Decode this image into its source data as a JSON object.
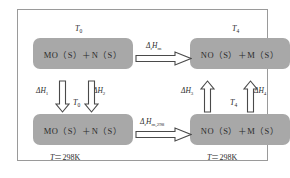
{
  "diagram": {
    "boxes": {
      "top_left": "MO（S）＋N（S）",
      "top_right": "NO（S）＋M（S）",
      "bottom_left": "MO（S）＋N（S）",
      "bottom_right": "NO（S）＋M（S）"
    },
    "temperatures": {
      "top_left": "T",
      "top_left_sub": "0",
      "top_right": "T",
      "top_right_sub": "4",
      "mid_left": "T",
      "mid_left_sub": "0",
      "mid_right": "T",
      "mid_right_sub": "4",
      "bottom_left": "T",
      "bottom_left_eq": "＝298K",
      "bottom_right": "T",
      "bottom_right_eq": "＝298K"
    },
    "enthalpies": {
      "top": "Δ",
      "top_sub1": "r",
      "top_main": "H",
      "top_sub2": "m",
      "bottom": "Δ",
      "bottom_sub1": "r",
      "bottom_main": "H",
      "bottom_sub2": "m,298",
      "dh1": "ΔH",
      "dh1_sub": "1",
      "dh2": "ΔH",
      "dh2_sub": "2",
      "dh3": "ΔH",
      "dh3_sub": "3",
      "dh4": "ΔH",
      "dh4_sub": "4"
    },
    "arrows": {
      "top_horizontal": "arrow-right",
      "bottom_horizontal": "arrow-right",
      "dh1": "arrow-down",
      "dh2": "arrow-down",
      "dh3": "arrow-up",
      "dh4": "arrow-up"
    },
    "colors": {
      "box_fill": "#a8a8a8",
      "frame_border": "#9a9a9a",
      "arrow_stroke": "#4a4a4a",
      "arrow_fill": "#ffffff",
      "text": "#2b2b2b",
      "background": "#ffffff"
    }
  }
}
